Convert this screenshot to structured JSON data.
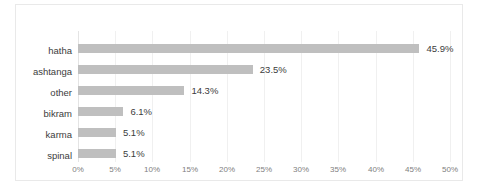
{
  "chart_data": {
    "type": "bar",
    "orientation": "horizontal",
    "title": "",
    "subtitle": "",
    "xlabel": "",
    "ylabel": "",
    "categories": [
      "hatha",
      "ashtanga",
      "other",
      "bikram",
      "karma",
      "spinal"
    ],
    "values": [
      45.9,
      23.5,
      14.3,
      6.1,
      5.1,
      5.1
    ],
    "data_labels": [
      "45.9%",
      "23.5%",
      "14.3%",
      "6.1%",
      "5.1%",
      "5.1%"
    ],
    "xlim": [
      0,
      50
    ],
    "xtick_values": [
      0,
      5,
      10,
      15,
      20,
      25,
      30,
      35,
      40,
      45,
      50
    ],
    "xtick_labels": [
      "0%",
      "5%",
      "10%",
      "15%",
      "20%",
      "25%",
      "30%",
      "35%",
      "40%",
      "45%",
      "50%"
    ],
    "grid": true,
    "grid_axis": "x",
    "legend": false,
    "legend_position": "none",
    "series": [
      {
        "name": "",
        "values": [
          45.9,
          23.5,
          14.3,
          6.1,
          5.1,
          5.1
        ]
      }
    ]
  },
  "colors": {
    "bar": "#bfbfbf",
    "gridline": "#f0f0f0",
    "axis": "#e4e4e4",
    "frame_border": "#e9e9e9",
    "category_text": "#3c3c3c",
    "tick_text": "#808080",
    "background": "#ffffff"
  }
}
